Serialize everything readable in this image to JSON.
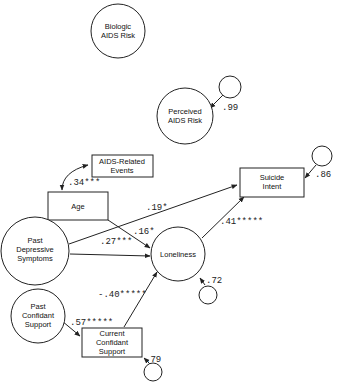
{
  "diagram": {
    "type": "path-analysis",
    "nodes": [
      {
        "id": "biologic",
        "shape": "circle",
        "lines": [
          "Biologic",
          "AIDS Risk"
        ]
      },
      {
        "id": "perceived",
        "shape": "circle",
        "lines": [
          "Perceived",
          "AIDS Risk"
        ]
      },
      {
        "id": "aids_events",
        "shape": "rect",
        "lines": [
          "AIDS-Related",
          "Events"
        ]
      },
      {
        "id": "age",
        "shape": "rect",
        "lines": [
          "Age"
        ]
      },
      {
        "id": "suicide",
        "shape": "rect",
        "lines": [
          "Suicide",
          "Intent"
        ]
      },
      {
        "id": "past_dep",
        "shape": "circle",
        "lines": [
          "Past",
          "Depressive",
          "Symptoms"
        ]
      },
      {
        "id": "loneliness",
        "shape": "circle",
        "lines": [
          "Loneliness"
        ]
      },
      {
        "id": "past_conf",
        "shape": "circle",
        "lines": [
          "Past",
          "Confidant",
          "Support"
        ]
      },
      {
        "id": "curr_conf",
        "shape": "rect",
        "lines": [
          "Current",
          "Confidant",
          "Support"
        ]
      }
    ],
    "edges": [
      {
        "from": "aids_events",
        "to": "age",
        "label": ".34***",
        "type": "correlation"
      },
      {
        "from": "past_dep",
        "to": "suicide",
        "label": ".19*"
      },
      {
        "from": "age",
        "to": "loneliness",
        "label": ".16*"
      },
      {
        "from": "past_dep",
        "to": "loneliness",
        "label": ".27***"
      },
      {
        "from": "loneliness",
        "to": "suicide",
        "label": ".41*****"
      },
      {
        "from": "curr_conf",
        "to": "loneliness",
        "label": "-.40*****"
      },
      {
        "from": "past_conf",
        "to": "curr_conf",
        "label": ".57*****"
      }
    ],
    "residuals": [
      {
        "target": "perceived",
        "label": ".99"
      },
      {
        "target": "suicide",
        "label": ".86"
      },
      {
        "target": "loneliness",
        "label": ".72"
      },
      {
        "target": "curr_conf",
        "label": ".79"
      }
    ]
  }
}
